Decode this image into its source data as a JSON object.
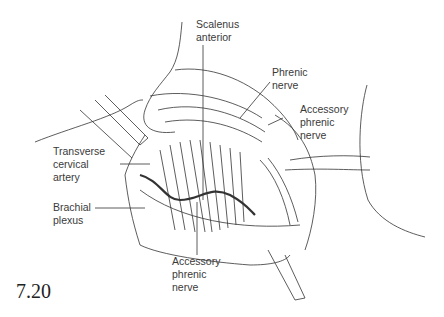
{
  "figure": {
    "number": "7.20",
    "type": "anatomical illustration",
    "labels": [
      {
        "id": "scalenus-anterior",
        "text": "Scalenus\nanterior"
      },
      {
        "id": "phrenic-nerve",
        "text": "Phrenic\nnerve"
      },
      {
        "id": "accessory-phrenic-nerve-upper",
        "text": "Accessory\nphrenic\nnerve"
      },
      {
        "id": "transverse-cervical-artery",
        "text": "Transverse\ncervical\nartery"
      },
      {
        "id": "brachial-plexus",
        "text": "Brachial\nplexus"
      },
      {
        "id": "accessory-phrenic-nerve-lower",
        "text": "Accessory\nphrenic\nnerve"
      }
    ]
  }
}
